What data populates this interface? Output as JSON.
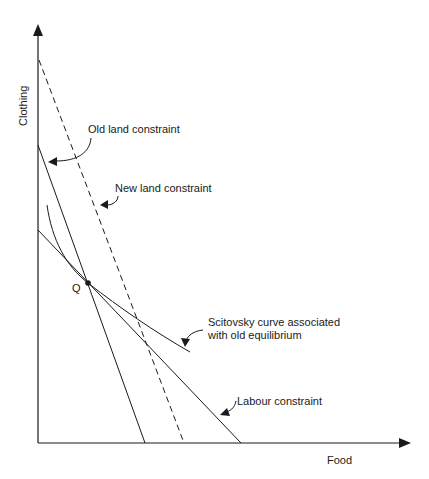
{
  "diagram": {
    "axes": {
      "x_label": "Food",
      "y_label": "Clothing"
    },
    "lines": [
      {
        "id": "old-land-constraint",
        "label": "Old land constraint",
        "style": "solid"
      },
      {
        "id": "new-land-constraint",
        "label": "New land constraint",
        "style": "dashed"
      },
      {
        "id": "labour-constraint",
        "label": "Labour constraint",
        "style": "solid"
      },
      {
        "id": "scitovsky-curve",
        "label_line1": "Scitovsky curve associated",
        "label_line2": "with old equilibrium",
        "style": "solid"
      }
    ],
    "points": [
      {
        "id": "Q",
        "label": "Q"
      }
    ],
    "colors": {
      "ink": "#1a1a1a",
      "background": "#ffffff"
    }
  }
}
